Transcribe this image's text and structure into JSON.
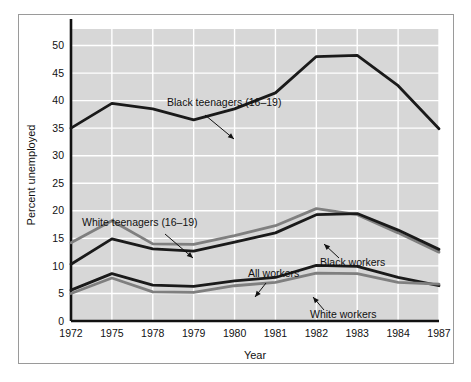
{
  "chart_data": {
    "type": "line",
    "title": "",
    "xlabel": "Year",
    "ylabel": "Percent unemployed",
    "categories": [
      "1972",
      "1975",
      "1978",
      "1979",
      "1980",
      "1981",
      "1982",
      "1983",
      "1984",
      "1987"
    ],
    "ylim": [
      0,
      53
    ],
    "yticks": [
      0,
      5,
      10,
      15,
      20,
      25,
      30,
      35,
      40,
      45,
      50
    ],
    "ytick_labels": [
      "0",
      "5",
      "10",
      "15",
      "20",
      "25",
      "30",
      "35",
      "40",
      "45",
      "50"
    ],
    "grid": true,
    "grid_color": "#ffffff",
    "plot_background": "#d7d7d7",
    "legend": "annotations",
    "series": [
      {
        "name": "Black teenagers (16–19)",
        "color": "#1a1a1a",
        "values": [
          35.0,
          39.5,
          38.5,
          36.5,
          38.5,
          41.4,
          48.0,
          48.2,
          42.7,
          34.9
        ]
      },
      {
        "name": "White teenagers (16–19)",
        "color": "#7f7f7f",
        "values": [
          14.2,
          18.2,
          14.0,
          13.9,
          15.5,
          17.3,
          20.4,
          19.3,
          16.0,
          12.5
        ]
      },
      {
        "name": "Black workers",
        "color": "#1a1a1a",
        "values": [
          10.3,
          14.9,
          13.1,
          12.7,
          14.3,
          16.0,
          19.3,
          19.5,
          16.5,
          13.0
        ]
      },
      {
        "name": "All workers",
        "color": "#1a1a1a",
        "values": [
          5.6,
          8.6,
          6.5,
          6.3,
          7.3,
          7.9,
          10.1,
          9.9,
          7.9,
          6.4
        ]
      },
      {
        "name": "White workers",
        "color": "#7f7f7f",
        "values": [
          5.0,
          7.8,
          5.3,
          5.2,
          6.4,
          7.0,
          8.7,
          8.6,
          7.0,
          6.7
        ]
      }
    ],
    "annotations": [
      {
        "id": "black-teenagers",
        "label": "Black teenagers (16–19)",
        "text_x": 148,
        "text_y": 91,
        "arrow": {
          "x1": 186,
          "y1": 100,
          "x2": 215,
          "y2": 124
        }
      },
      {
        "id": "white-teenagers",
        "label": "White teenagers (16–19)",
        "text_x": 63,
        "text_y": 211,
        "arrow": {
          "x1": 146,
          "y1": 219,
          "x2": 174,
          "y2": 243
        }
      },
      {
        "id": "black-workers",
        "label": "Black workers",
        "text_x": 301,
        "text_y": 251,
        "arrow": {
          "x1": 320,
          "y1": 243,
          "x2": 305,
          "y2": 229
        }
      },
      {
        "id": "all-workers",
        "label": "All workers",
        "text_x": 229,
        "text_y": 262,
        "arrow": {
          "x1": 247,
          "y1": 268,
          "x2": 236,
          "y2": 282
        }
      },
      {
        "id": "white-workers",
        "label": "White workers",
        "text_x": 291,
        "text_y": 303,
        "arrow": {
          "x1": 305,
          "y1": 295,
          "x2": 294,
          "y2": 282
        }
      }
    ]
  }
}
